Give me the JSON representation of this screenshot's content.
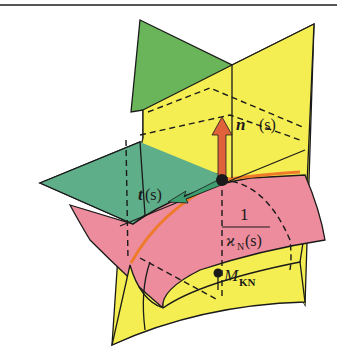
{
  "figure": {
    "colors": {
      "green_plane": "#6ab55a",
      "teal_plane": "#5fae8a",
      "yellow_plane": "#f5ee52",
      "pink_surface": "#ec8c9c",
      "curve": "#ee7a2a",
      "normal_arrow": "#e0623a",
      "tangent_arrow": "#3e9e70",
      "outline": "#1a1a1a"
    },
    "labels": {
      "normal_vector": "n",
      "normal_arg": "(s)",
      "tangent_vector": "t",
      "tangent_arg": "(s)",
      "fraction_numerator": "1",
      "fraction_denominator_symbol": "ϰ",
      "fraction_denominator_sub": "N",
      "fraction_denominator_arg": "(s)",
      "center_point": "M",
      "center_point_sub": "KN"
    }
  }
}
